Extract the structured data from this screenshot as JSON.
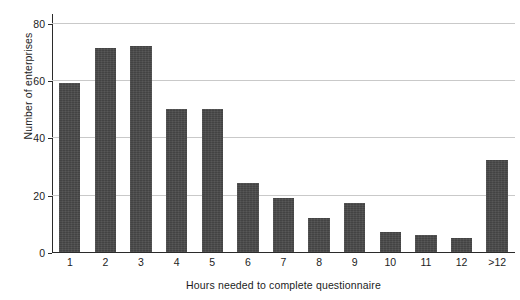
{
  "chart_data": {
    "type": "bar",
    "title": "",
    "xlabel": "Hours needed to complete questionnaire",
    "ylabel": "Number of enterprises",
    "categories": [
      "1",
      "2",
      "3",
      "4",
      "5",
      "6",
      "7",
      "8",
      "9",
      "10",
      "11",
      "12",
      ">12"
    ],
    "values": [
      59,
      71,
      72,
      50,
      50,
      24,
      19,
      12,
      17,
      7,
      6,
      5,
      32
    ],
    "ylim": [
      0,
      83
    ],
    "yticks": [
      0,
      20,
      40,
      60,
      80
    ],
    "ytick_labels": [
      "0",
      "20",
      "40",
      "60",
      "80"
    ],
    "gridlines": [
      20,
      40,
      60,
      80
    ],
    "grid": true,
    "legend": null,
    "bar_color": "#4a4a4a",
    "grid_color": "#c9c9c9",
    "axis_color": "#2b2b2b",
    "background": "#ffffff"
  }
}
